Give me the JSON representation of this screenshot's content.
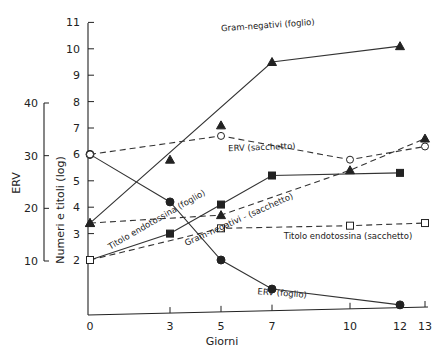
{
  "chart_data": {
    "type": "line",
    "title": "",
    "xlabel": "Giorni",
    "ylabel": "Numeri e titoli (log)",
    "y2label": "ERV",
    "x_ticks": [
      0,
      3,
      5,
      7,
      10,
      12,
      13
    ],
    "y_ticks": [
      2,
      3,
      4,
      5,
      6,
      7,
      8,
      9,
      10,
      11
    ],
    "y2_ticks": [
      10,
      20,
      30,
      40
    ],
    "xlim": [
      0,
      13
    ],
    "ylim": [
      0,
      11
    ],
    "y2lim": [
      10,
      40
    ],
    "grid": false,
    "series": [
      {
        "name": "Gram-negativi (foglio)",
        "style": "solid",
        "marker": "filled-triangle",
        "x": [
          0,
          7,
          12
        ],
        "values": [
          3.4,
          9.5,
          10.1
        ],
        "extra_points": [
          {
            "x": 3,
            "y": 5.8
          },
          {
            "x": 5,
            "y": 7.1
          }
        ]
      },
      {
        "name": "Gram-negativi - (sacchetto)",
        "style": "dashed",
        "marker": "filled-triangle",
        "x": [
          0,
          5,
          10,
          13
        ],
        "values": [
          3.4,
          3.7,
          5.4,
          6.6
        ]
      },
      {
        "name": "ERV (foglio)",
        "style": "solid",
        "marker": "filled-circle",
        "x": [
          0,
          3,
          5,
          7,
          12
        ],
        "values": [
          6.0,
          4.2,
          2.0,
          0.9,
          0.3
        ]
      },
      {
        "name": "ERV (sacchetto)",
        "style": "dashed",
        "marker": "open-circle",
        "x": [
          0,
          5,
          10,
          13
        ],
        "values": [
          6.0,
          6.7,
          5.8,
          6.3
        ]
      },
      {
        "name": "Titolo endotossina (foglio)",
        "style": "solid",
        "marker": "filled-square",
        "x": [
          0,
          3,
          5,
          7,
          12
        ],
        "values": [
          2.0,
          3.0,
          4.1,
          5.2,
          5.3
        ]
      },
      {
        "name": "Titolo endotossina (sacchetto)",
        "style": "dashed",
        "marker": "open-square",
        "x": [
          0,
          5,
          10,
          13
        ],
        "values": [
          2.0,
          3.2,
          3.3,
          3.4
        ]
      }
    ]
  }
}
